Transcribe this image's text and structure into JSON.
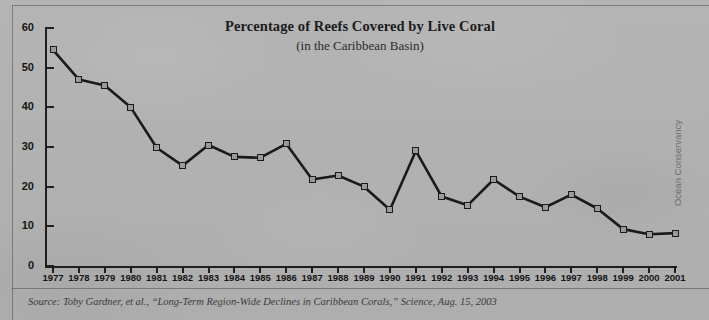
{
  "chart_data": {
    "type": "line",
    "title": "Percentage of Reefs Covered by Live Coral",
    "subtitle": "(in the Caribbean Basin)",
    "xlabel": "",
    "ylabel": "",
    "ylim": [
      0,
      60
    ],
    "yticks": [
      0,
      10,
      20,
      30,
      40,
      50,
      60
    ],
    "grid": false,
    "legend": null,
    "categories": [
      "1977",
      "1978",
      "1979",
      "1980",
      "1981",
      "1982",
      "1983",
      "1984",
      "1985",
      "1986",
      "1987",
      "1988",
      "1989",
      "1990",
      "1991",
      "1992",
      "1993",
      "1994",
      "1995",
      "1996",
      "1997",
      "1998",
      "1999",
      "2000",
      "2001"
    ],
    "values": [
      54.5,
      47,
      45.5,
      40,
      29.8,
      25.3,
      30.5,
      27.5,
      27.3,
      30.8,
      21.8,
      22.8,
      20,
      14.2,
      29,
      17.5,
      15.3,
      21.8,
      17.5,
      14.8,
      18,
      14.5,
      9.3,
      8,
      8.3
    ],
    "series_color": "#1a1a1a",
    "marker_fill": "#9a9a9a",
    "marker_edge": "#1a1a1a"
  },
  "footer": {
    "source": "Source: Toby Gardner, et al., “Long-Term Region-Wide Declines in Caribbean Corals,” Science, Aug. 15, 2003",
    "credit": "Ocean Conservancy"
  },
  "colors": {
    "background": "#b2b2b2",
    "axis": "#1f1f1f",
    "text": "#151515"
  }
}
